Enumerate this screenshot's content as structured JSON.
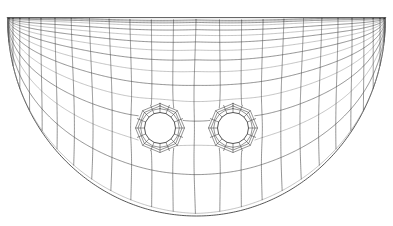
{
  "figure": {
    "kind": "finite-element-mesh",
    "title": "",
    "canvas": {
      "width": 393,
      "height": 226
    },
    "background_color": "#ffffff",
    "line_color": "#3c3c3c",
    "faint_line_color": "#8a8a8a",
    "boundary_color": "#2b2b2b",
    "line_width": 0.55,
    "boundary_line_width": 0.8
  },
  "domain": {
    "shape": "half-disc",
    "center_x": 196.5,
    "top_y": 18.0,
    "radius_x": 189.0,
    "radius_y": 198.0,
    "flat_edge": "top",
    "arc_edge": "bottom",
    "left_x": 7.5,
    "right_x": 385.5,
    "bottom_y": 216.0
  },
  "holes": [
    {
      "name": "left-hole",
      "center_x": 160.0,
      "center_y": 128.0,
      "radius": 15.5,
      "ring_outer_radius": 24.5,
      "ring_layers": 3,
      "sectors": 16
    },
    {
      "name": "right-hole",
      "center_x": 233.0,
      "center_y": 128.0,
      "radius": 15.5,
      "ring_outer_radius": 24.5,
      "ring_layers": 3,
      "sectors": 16
    }
  ],
  "mesh": {
    "symmetry_axis_x": 196.5,
    "radial_divisions": 16,
    "circumferential_divisions": 26,
    "boundary_layer": {
      "location": "top-edge",
      "layers": 4,
      "first_layer_thickness": 2.0,
      "growth_ratio": 1.7
    },
    "grading": {
      "type": "geometric",
      "toward": "top-edge-and-holes",
      "ratio": 1.22
    },
    "element_type": "quad4",
    "approx_element_count": 640
  },
  "annotations": []
}
